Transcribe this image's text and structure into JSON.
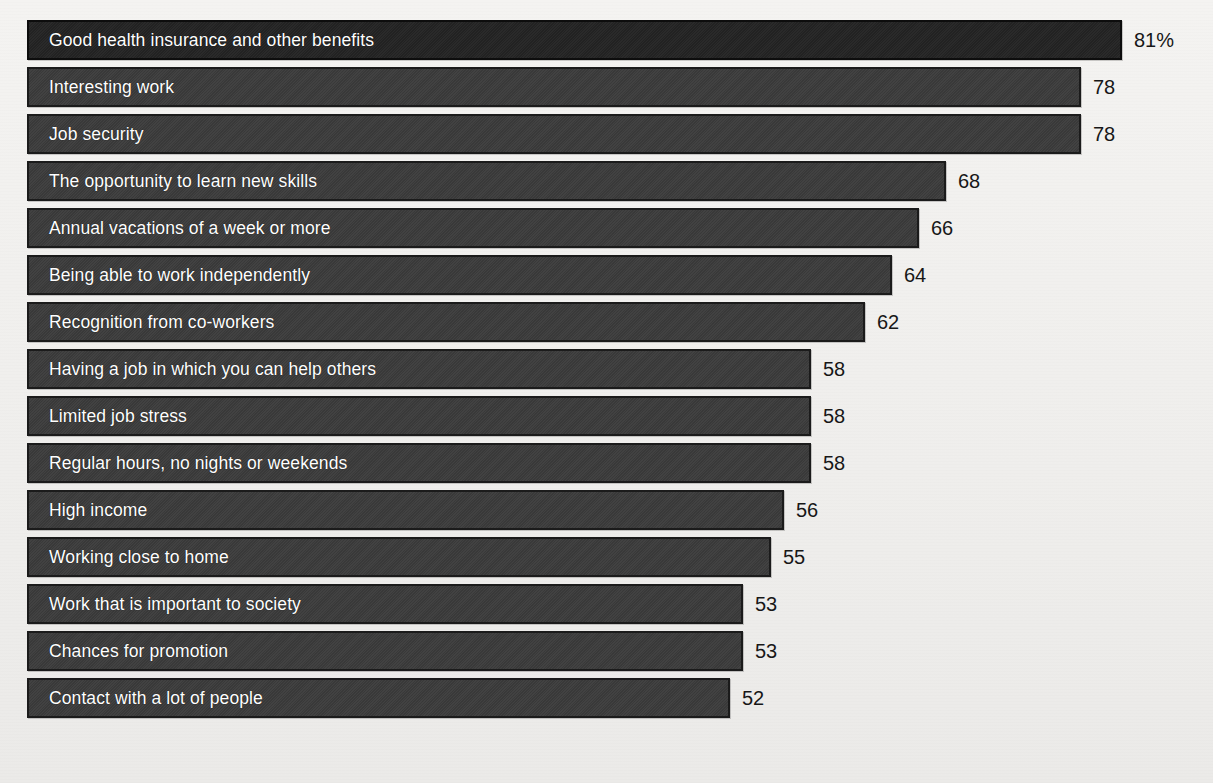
{
  "chart_data": {
    "type": "bar",
    "orientation": "horizontal",
    "title": "",
    "subtitle": "",
    "xlabel": "",
    "ylabel": "",
    "xlim": [
      0,
      81
    ],
    "grid": false,
    "legend": null,
    "value_suffix_first": "%",
    "categories": [
      "Good health insurance and other benefits",
      "Interesting work",
      "Job security",
      "The opportunity to learn new skills",
      "Annual vacations of a week or more",
      "Being able to work independently",
      "Recognition from co-workers",
      "Having a job in which you can help others",
      "Limited job stress",
      "Regular hours, no nights or weekends",
      "High income",
      "Working close to home",
      "Work that is important to society",
      "Chances for promotion",
      "Contact with a lot of people"
    ],
    "values": [
      81,
      78,
      78,
      68,
      66,
      64,
      62,
      58,
      58,
      58,
      56,
      55,
      53,
      53,
      52
    ],
    "value_labels": [
      "81%",
      "78",
      "78",
      "68",
      "66",
      "64",
      "62",
      "58",
      "58",
      "58",
      "56",
      "55",
      "53",
      "53",
      "52"
    ]
  },
  "colors": {
    "background": "#f2f1ef",
    "bar_fill": "#3b3b3b",
    "bar_fill_top": "#232323",
    "bar_border": "#1b1b1b",
    "label_text": "#ffffff",
    "value_text": "#171717"
  }
}
